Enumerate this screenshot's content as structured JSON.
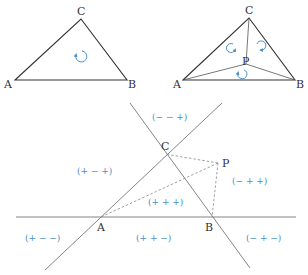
{
  "figure1": {
    "title": "Triangle ABC with orientation",
    "vertices": {
      "A": {
        "label": "A",
        "x": 15,
        "y": 80
      },
      "B": {
        "label": "B",
        "x": 127,
        "y": 80
      },
      "C": {
        "label": "C",
        "x": 81,
        "y": 19
      }
    },
    "orientation_symbol": "counterclockwise-arrow"
  },
  "figure2": {
    "title": "Triangle ABC split by interior point P",
    "vertices": {
      "A": {
        "label": "A",
        "x": 183,
        "y": 80
      },
      "B": {
        "label": "B",
        "x": 295,
        "y": 80
      },
      "C": {
        "label": "C",
        "x": 249,
        "y": 18
      },
      "P": {
        "label": "P",
        "x": 246,
        "y": 64
      }
    },
    "orientation_symbols": [
      "rotation-arrow",
      "rotation-arrow",
      "rotation-arrow"
    ]
  },
  "figure3": {
    "title": "Sign regions of lines AB, BC, CA",
    "points": {
      "A": {
        "label": "A"
      },
      "B": {
        "label": "B"
      },
      "C": {
        "label": "C"
      },
      "P": {
        "label": "P"
      }
    },
    "regions": [
      {
        "id": "top",
        "label": "(− − +)"
      },
      {
        "id": "left",
        "label": "(+ − +)"
      },
      {
        "id": "inside",
        "label": "(+ + +)"
      },
      {
        "id": "right",
        "label": "(− + +)"
      },
      {
        "id": "bottom-left",
        "label": "(+ − −)"
      },
      {
        "id": "bottom-middle",
        "label": "(+ + −)"
      },
      {
        "id": "bottom-right",
        "label": "(− + −)"
      }
    ]
  },
  "colors": {
    "line": "#333333",
    "sign_text": "#4a90c8",
    "rotation_arrow": "#4a90c8"
  }
}
